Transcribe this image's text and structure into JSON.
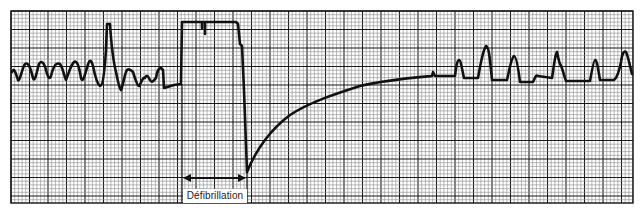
{
  "figure": {
    "type": "ecg-rhythm-strip",
    "annotation_label": "Défibrillation",
    "colors": {
      "paper": "#ffffff",
      "grid_minor": "#8a8a8a",
      "grid_major": "#1a1a1a",
      "trace": "#111111"
    }
  },
  "grid": {
    "x0": 11,
    "y0": 11,
    "x1": 633,
    "y1": 203,
    "minor": 3.7,
    "major": 18.5
  },
  "segments": [
    {
      "name": "ventricular-fibrillation",
      "x_range": [
        11,
        182
      ]
    },
    {
      "name": "defibrillation-artifact",
      "x_range": [
        182,
        247
      ]
    },
    {
      "name": "post-shock-recovery",
      "x_range": [
        247,
        430
      ]
    },
    {
      "name": "resumed-rhythm",
      "x_range": [
        430,
        633
      ]
    }
  ]
}
